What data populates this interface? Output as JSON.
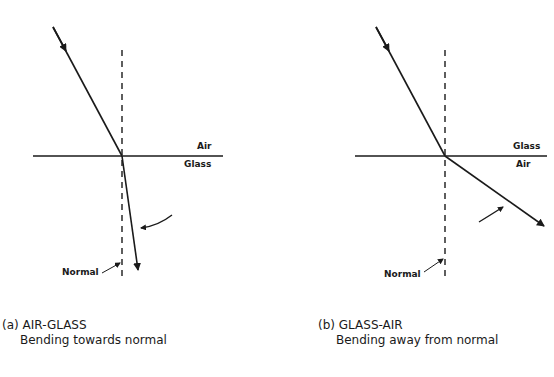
{
  "panels": [
    {
      "id": "a",
      "upper_medium": "Air",
      "lower_medium": "Glass",
      "normal_label": "Normal",
      "caption_title": "(a) AIR-GLASS",
      "caption_subtitle": "Bending towards normal"
    },
    {
      "id": "b",
      "upper_medium": "Glass",
      "lower_medium": "Air",
      "normal_label": "Normal",
      "caption_title": "(b) GLASS-AIR",
      "caption_subtitle": "Bending away from normal"
    }
  ],
  "colors": {
    "ink": "#1a1a1a",
    "background": "#ffffff"
  }
}
